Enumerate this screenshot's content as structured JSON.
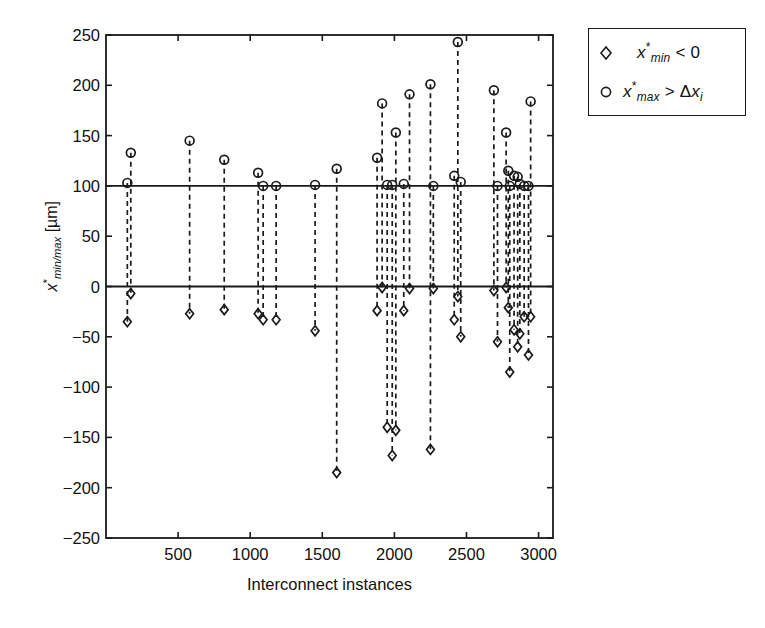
{
  "chart_data": {
    "type": "scatter",
    "title": "",
    "xlabel": "Interconnect instances",
    "ylabel": "x*_min/max [μm]",
    "ylabel_parts": {
      "base": "x",
      "star": "*",
      "sub": "min/max",
      "unit": "[μm]"
    },
    "xlim": [
      0,
      3100
    ],
    "ylim": [
      -250,
      250
    ],
    "xticks": [
      500,
      1000,
      1500,
      2000,
      2500,
      3000
    ],
    "yticks": [
      250,
      200,
      150,
      100,
      50,
      0,
      -50,
      -100,
      -150,
      -200,
      -250
    ],
    "grid": false,
    "reference_lines": [
      {
        "name": "zero-line",
        "y": 0
      },
      {
        "name": "spec-line",
        "y": 100
      }
    ],
    "legend": {
      "position": "outside-top-right",
      "entries": [
        {
          "marker": "diamond",
          "label": "x*min < 0",
          "parts": {
            "base": "x",
            "star": "*",
            "sub": "min",
            "rel": "< 0"
          }
        },
        {
          "marker": "circle",
          "label": "x*max > Δxi",
          "parts": {
            "base": "x",
            "star": "*",
            "sub": "max",
            "rel": "> Δx",
            "rel_sub": "i"
          }
        }
      ]
    },
    "series": [
      {
        "name": "x*max > Δxi",
        "marker": "circle",
        "x": [
          148,
          172,
          580,
          820,
          1055,
          1090,
          1180,
          1450,
          1600,
          1880,
          1915,
          1950,
          1985,
          2010,
          2065,
          2105,
          2250,
          2270,
          2415,
          2440,
          2460,
          2690,
          2715,
          2775,
          2790,
          2800,
          2830,
          2855,
          2870,
          2900,
          2930,
          2945
        ],
        "values": [
          103,
          133,
          145,
          126,
          113,
          100,
          100,
          101,
          117,
          128,
          182,
          101,
          101,
          153,
          102,
          191,
          201,
          100,
          110,
          243,
          104,
          195,
          100,
          153,
          115,
          100,
          110,
          109,
          102,
          100,
          100,
          184
        ]
      },
      {
        "name": "x*min < 0",
        "marker": "diamond",
        "x": [
          148,
          172,
          580,
          820,
          1055,
          1090,
          1180,
          1450,
          1600,
          1880,
          1915,
          1950,
          1985,
          2010,
          2065,
          2105,
          2250,
          2270,
          2415,
          2440,
          2460,
          2690,
          2715,
          2775,
          2790,
          2800,
          2830,
          2855,
          2870,
          2900,
          2930,
          2945
        ],
        "values": [
          -35,
          -7,
          -27,
          -23,
          -27,
          -33,
          -33,
          -44,
          -185,
          -24,
          -1,
          -140,
          -168,
          -143,
          -24,
          -2,
          -162,
          -2,
          -33,
          -10,
          -50,
          -4,
          -55,
          -1,
          -21,
          -85,
          -43,
          -60,
          -47,
          -30,
          -68,
          -30
        ]
      }
    ],
    "colors": {
      "marker": "#1a1a1a",
      "stem": "#1a1a1a",
      "axis": "#1a1a1a",
      "background": "#ffffff"
    }
  },
  "axes": {
    "plot_left_px": 106,
    "plot_right_px": 553,
    "plot_top_px": 35,
    "plot_bottom_px": 538
  }
}
